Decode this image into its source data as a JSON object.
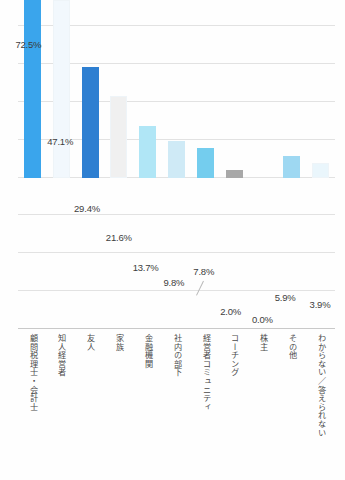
{
  "chart_data": {
    "type": "bar",
    "title": "",
    "subtitle": "",
    "xlabel": "",
    "ylabel": "",
    "ylim": [
      0,
      80
    ],
    "grid": true,
    "legend": "none",
    "gridlines": [
      0,
      10,
      20,
      30,
      40,
      50,
      60,
      70,
      80
    ],
    "categories": [
      "顧問税理士・会計士",
      "知人経営者",
      "友人",
      "家族",
      "金融機関",
      "社内の部下",
      "経営者コミュニティ",
      "コーチング",
      "株主",
      "その他",
      "わからない／答えられない"
    ],
    "values": [
      72.5,
      47.1,
      29.4,
      21.6,
      13.7,
      9.8,
      7.8,
      2.0,
      0.0,
      5.9,
      3.9
    ],
    "value_labels": [
      "72.5%",
      "47.1%",
      "29.4%",
      "21.6%",
      "13.7%",
      "9.8%",
      "7.8%",
      "2.0%",
      "0.0%",
      "5.9%",
      "3.9%"
    ],
    "bar_colors": [
      "#3aa5ec",
      "#f2f8fd",
      "#2e7fd1",
      "#f0f0f0",
      "#b0e6f6",
      "#cfeaf6",
      "#74cdee",
      "#a8a8a8",
      "#ffffff",
      "#9ed8f2",
      "#eaf6fc"
    ]
  },
  "colors": {
    "background": "#fefefe",
    "gridline": "#e2e2e2",
    "axis": "#c9c9c9",
    "label_text": "#3d3d3d",
    "category_text": "#4a4a4a",
    "accent_primary": "#3aa5ec",
    "accent_dark": "#2e7fd1",
    "neutral_gray": "#a8a8a8"
  }
}
